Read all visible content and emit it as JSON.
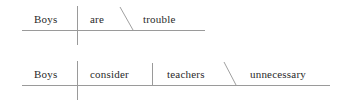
{
  "image": {
    "kind": "reed-kellogg-sentence-diagram",
    "background_color": "#ffffff",
    "line_color": "#9a9a9a",
    "text_color": "#2a2a2a"
  },
  "diagrams": [
    {
      "id": "diagram-1",
      "sentence": "Boys are trouble",
      "baseline": {
        "x1": 22,
        "y": 30,
        "x2": 205
      },
      "subject_divider": {
        "x": 77,
        "y1": 6,
        "y2": 45
      },
      "complement_slant": {
        "x1": 120,
        "y1": 7,
        "x2": 133,
        "y2": 30
      },
      "words": [
        {
          "role": "subject",
          "text": "Boys",
          "x": 34,
          "y": 14
        },
        {
          "role": "verb",
          "text": "are",
          "x": 90,
          "y": 14
        },
        {
          "role": "predicate-nominative",
          "text": "trouble",
          "x": 143,
          "y": 14
        }
      ]
    },
    {
      "id": "diagram-2",
      "sentence": "Boys consider teachers unnecessary",
      "baseline": {
        "x1": 22,
        "y": 85,
        "x2": 330
      },
      "subject_divider": {
        "x": 77,
        "y1": 61,
        "y2": 100
      },
      "object_divider": {
        "x": 152,
        "y1": 63,
        "y2": 85
      },
      "complement_slant": {
        "x1": 224,
        "y1": 62,
        "x2": 236,
        "y2": 85
      },
      "words": [
        {
          "role": "subject",
          "text": "Boys",
          "x": 34,
          "y": 69
        },
        {
          "role": "verb",
          "text": "consider",
          "x": 90,
          "y": 69
        },
        {
          "role": "direct-object",
          "text": "teachers",
          "x": 167,
          "y": 69
        },
        {
          "role": "object-complement",
          "text": "unnecessary",
          "x": 250,
          "y": 69
        }
      ]
    }
  ]
}
